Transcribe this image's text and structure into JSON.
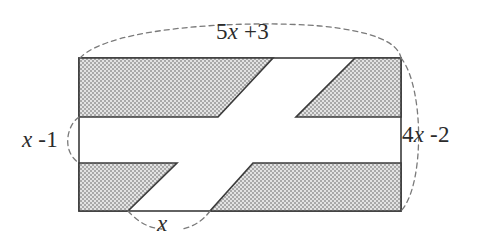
{
  "figure": {
    "background_color": "#ffffff",
    "outline_color": "#3b3b3b",
    "shade_fill_color": "#c9c9c9",
    "shade_pattern": "gray-stipple",
    "dash_color": "#7a7a7a",
    "rectangle": {
      "left": 79,
      "top": 58,
      "right": 401,
      "bottom": 211,
      "width_px": 322,
      "height_px": 153
    },
    "white_band": {
      "top": 117,
      "bottom": 163
    },
    "shaded_regions": [
      {
        "name": "top-left-parallelogram",
        "points": "79,58 273,58 218,117 79,117"
      },
      {
        "name": "top-right-trapezoid",
        "points": "355,58 401,58 401,117 296,117"
      },
      {
        "name": "bottom-left-parallelogram",
        "points": "79,163 177,163 128,211 79,211"
      },
      {
        "name": "bottom-right-trapezoid",
        "points": "253,163 401,163 401,211 210,211"
      }
    ],
    "dimension_arcs": [
      {
        "name": "top-arc",
        "path": "M 80,58 C 110,26 250,20 320,26 C 372,31 398,42 401,58"
      },
      {
        "name": "left-arc",
        "path": "M 79,117 C 66,126 62,152 79,163"
      },
      {
        "name": "right-arc",
        "path": "M 401,58 C 424,86 425,185 401,211"
      },
      {
        "name": "bottom-arc",
        "path": "M 128,211 C 140,224 150,228 162,229"
      },
      {
        "name": "bottom-arc-2",
        "path": "M 210,211 C 202,222 192,227 182,229"
      }
    ]
  },
  "labels": {
    "top": {
      "name": "top-dimension-label",
      "prefix": "5",
      "variable": "x",
      "suffix": " +3",
      "full": "5x +3"
    },
    "left": {
      "name": "left-dimension-label",
      "prefix": "",
      "variable": "x",
      "suffix": " -1",
      "full": "x -1"
    },
    "right": {
      "name": "right-dimension-label",
      "prefix": "4",
      "variable": "x",
      "suffix": " -2",
      "full": "4x -2"
    },
    "bottom": {
      "name": "bottom-dimension-label",
      "prefix": "",
      "variable": "x",
      "suffix": "",
      "full": "x"
    }
  }
}
